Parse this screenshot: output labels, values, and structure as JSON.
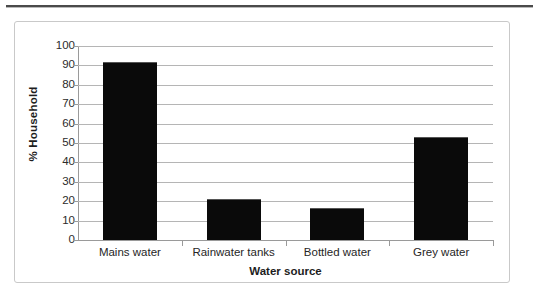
{
  "chart_data": {
    "type": "bar",
    "title": "",
    "categories": [
      "Mains water",
      "Rainwater tanks",
      "Bottled water",
      "Grey water"
    ],
    "values": [
      92,
      21,
      16.5,
      53
    ],
    "xlabel": "Water source",
    "ylabel": "% Household",
    "ylim": [
      0,
      100
    ],
    "ytick_step": 10,
    "yticks": [
      100,
      90,
      80,
      70,
      60,
      50,
      40,
      30,
      20,
      10,
      0
    ],
    "ytick_labels": [
      "100",
      "90",
      "80",
      "70",
      "60",
      "50",
      "40",
      "30",
      "20",
      "10",
      "0"
    ],
    "grid": true,
    "grid_axis": "y",
    "legend": false,
    "bar_color": "#0a0a0a",
    "gridline_color": "#b5b5b5",
    "axis_color": "#9a9a9a",
    "frame_color": "#c9c9c9"
  }
}
